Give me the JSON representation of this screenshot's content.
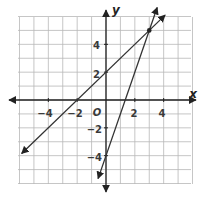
{
  "chart_data": {
    "type": "line",
    "title": "",
    "xlabel": "x",
    "ylabel": "y",
    "origin_label": "O",
    "xlim": [
      -6,
      6
    ],
    "ylim": [
      -6,
      6
    ],
    "grid": true,
    "x_tick_labels": [
      "-4",
      "-2",
      "2",
      "4"
    ],
    "y_tick_labels": [
      "4",
      "2",
      "-2",
      "-4"
    ],
    "x_ticks": [
      -4,
      -2,
      2,
      4
    ],
    "y_ticks": [
      4,
      2,
      -2,
      -4
    ],
    "series": [
      {
        "name": "line-1",
        "equation": "y = x + 2",
        "slope": 1,
        "intercept": 2,
        "x": [
          -6,
          4
        ],
        "y": [
          -4,
          6
        ]
      },
      {
        "name": "line-2",
        "equation": "y = 3x - 4",
        "slope": 3,
        "intercept": -4,
        "x": [
          -0.5,
          4
        ],
        "y": [
          -5.5,
          8
        ]
      }
    ],
    "points": [
      {
        "label": "intersection",
        "x": 3,
        "y": 5
      }
    ],
    "colors": {
      "grid": "#b8b8b8",
      "axis": "#222222",
      "line": "#333333"
    }
  }
}
